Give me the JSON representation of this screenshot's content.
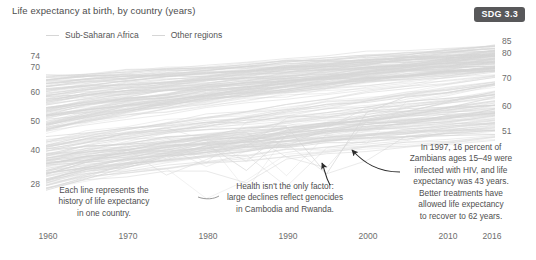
{
  "chart_data": {
    "type": "line",
    "title": "Life expectancy at birth, by country (years)",
    "xlabel": "",
    "ylabel": "",
    "grid": false,
    "legend_position": "top-left",
    "xlim": [
      1960,
      2016
    ],
    "ylim": [
      28,
      85
    ],
    "x_ticks": [
      "1960",
      "1970",
      "1980",
      "1990",
      "2000",
      "2010",
      "2016"
    ],
    "y_ticks_left": [
      "74",
      "70",
      "60",
      "50",
      "40",
      "28"
    ],
    "y_ticks_right": [
      "85",
      "80",
      "70",
      "60",
      "51"
    ],
    "series": [
      {
        "name": "Sub-Saharan Africa",
        "color": "#d6d6d6",
        "note": "Lower band of country trajectories; many dip sharply in the 1990s due to HIV/AIDS",
        "x": [
          1960,
          1970,
          1980,
          1990,
          1997,
          2005,
          2016
        ],
        "values": [
          40,
          45,
          48,
          50,
          43,
          48,
          60
        ]
      },
      {
        "name": "Other regions",
        "color": "#d6d6d6",
        "note": "Upper band of country trajectories rising steadily toward 80+",
        "x": [
          1960,
          1970,
          1980,
          1990,
          2000,
          2010,
          2016
        ],
        "values": [
          60,
          64,
          67,
          70,
          73,
          76,
          78
        ]
      }
    ],
    "annotations": [
      {
        "id": "each-line",
        "text": "Each line represents the history of life expectancy in one country."
      },
      {
        "id": "genocides",
        "text": "Health isn't the only factor: large declines reflect genocides in Cambodia and Rwanda."
      },
      {
        "id": "zambia-hiv",
        "text": "In 1997, 16 percent of Zambians ages 15–49 were infected with HIV, and life expectancy was 43 years. Better treatments have allowed life expectancy to recover to 62 years."
      }
    ]
  },
  "header": {
    "title": "Life expectancy at birth, by country (years)",
    "badge": "SDG 3.3"
  },
  "legend": {
    "items": [
      {
        "label": "Sub-Saharan Africa"
      },
      {
        "label": "Other regions"
      }
    ]
  },
  "axes": {
    "y_left": [
      "74",
      "70",
      "60",
      "50",
      "40",
      "28"
    ],
    "y_right": [
      "85",
      "80",
      "70",
      "60",
      "51"
    ],
    "x": [
      "1960",
      "1970",
      "1980",
      "1990",
      "2000",
      "2010",
      "2016"
    ]
  },
  "annotations": {
    "each_line": {
      "line1": "Each line represents the",
      "line2": "history of life expectancy",
      "line3": "in one country."
    },
    "genocides": {
      "line1": "Health isn't the only factor:",
      "line2": "large declines reflect genocides",
      "line3": "in Cambodia and Rwanda."
    },
    "zambia": {
      "line1": "In 1997, 16 percent of",
      "line2": "Zambians ages 15–49 were",
      "line3": "infected with HIV, and life",
      "line4": "expectancy was 43 years.",
      "line5": "Better treatments have",
      "line6": "allowed life expectancy",
      "line7": "to recover to 62 years."
    }
  },
  "colors": {
    "line": "#d6d6d6",
    "badge_bg": "#58585a",
    "badge_text": "#ffffff",
    "text": "#4f4f4f",
    "axis_text": "#6d6d6d",
    "background": "#ffffff"
  }
}
